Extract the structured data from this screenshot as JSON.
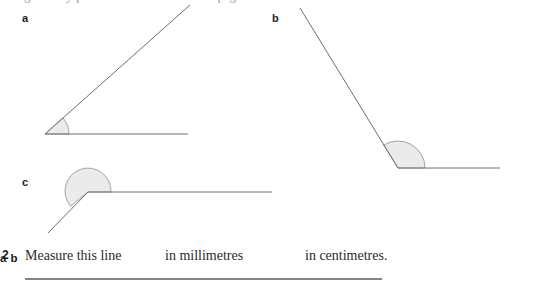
{
  "page": {
    "background_color": "#ffffff",
    "clipped_top_line": "geometry problems continued on the page above",
    "stroke_color": "#6e6e6e",
    "arc_fill_color": "#ebebeb",
    "arc_stroke_color": "#9a9a9a",
    "measure_line_color": "#5a5a5a"
  },
  "figures": [
    {
      "id": "figure-a",
      "label": "a",
      "angle_type": "acute",
      "vertex": {
        "x": 45,
        "y": 134
      },
      "rays": [
        {
          "name": "horizontal-ray",
          "end_x": 188,
          "end_y": 134
        },
        {
          "name": "inclined-ray",
          "end_x": 190,
          "end_y": 5
        }
      ],
      "arc": {
        "radius": 24,
        "start_deg": 0,
        "end_deg": 42
      }
    },
    {
      "id": "figure-b",
      "label": "b",
      "angle_type": "obtuse",
      "vertex": {
        "x": 398,
        "y": 168
      },
      "rays": [
        {
          "name": "horizontal-ray",
          "end_x": 500,
          "end_y": 168
        },
        {
          "name": "inclined-ray",
          "end_x": 300,
          "end_y": 8
        }
      ],
      "arc": {
        "radius": 27,
        "start_deg": 0,
        "end_deg": 122
      }
    },
    {
      "id": "figure-c",
      "label": "c",
      "angle_type": "reflex",
      "vertex": {
        "x": 88,
        "y": 192
      },
      "rays": [
        {
          "name": "horizontal-ray",
          "end_x": 272,
          "end_y": 192
        },
        {
          "name": "inclined-ray",
          "end_x": 48,
          "end_y": 233
        }
      ],
      "arc": {
        "radius": 23,
        "start_deg": 0,
        "end_deg": 221
      }
    }
  ],
  "question": {
    "number": "2",
    "stem": "Measure this line",
    "parts": [
      {
        "label": "a",
        "text": "in millimetres"
      },
      {
        "label": "b",
        "text": "in centimetres."
      }
    ],
    "measure_line": {
      "x1": 25,
      "x2": 382,
      "y": 279
    }
  }
}
